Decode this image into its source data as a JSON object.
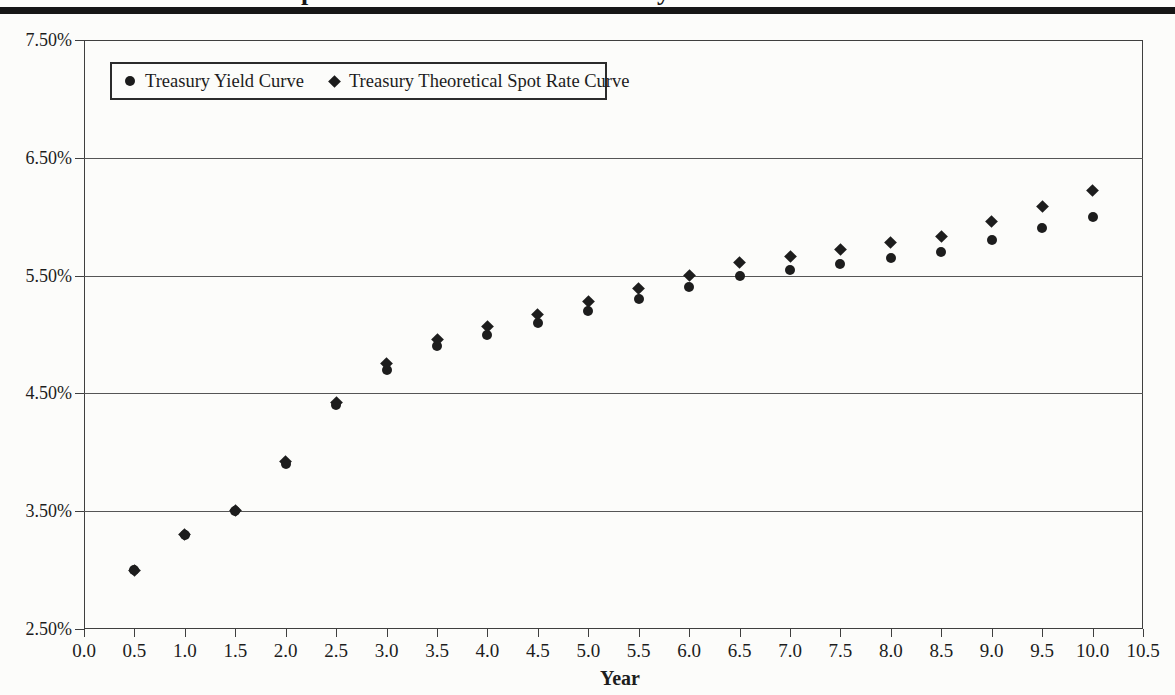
{
  "header": {
    "clipped_title_fragments": [
      "p",
      "y"
    ]
  },
  "legend": {
    "items": [
      {
        "marker": "circle",
        "label": "Treasury Yield Curve"
      },
      {
        "marker": "diamond",
        "label": "Treasury Theoretical Spot Rate Curve"
      }
    ]
  },
  "chart_data": {
    "type": "scatter",
    "title": "",
    "xlabel": "Year",
    "ylabel": "",
    "xlim": [
      0,
      10.5
    ],
    "ylim": [
      2.5,
      7.5
    ],
    "grid": "horizontal",
    "legend_position": "top-left-inside",
    "x_ticks": [
      "0.0",
      "0.5",
      "1.0",
      "1.5",
      "2.0",
      "2.5",
      "3.0",
      "3.5",
      "4.0",
      "4.5",
      "5.0",
      "5.5",
      "6.0",
      "6.5",
      "7.0",
      "7.5",
      "8.0",
      "8.5",
      "9.0",
      "9.5",
      "10.0",
      "10.5"
    ],
    "y_ticks": [
      "2.50%",
      "3.50%",
      "4.50%",
      "5.50%",
      "6.50%",
      "7.50%"
    ],
    "x": [
      0.5,
      1.0,
      1.5,
      2.0,
      2.5,
      3.0,
      3.5,
      4.0,
      4.5,
      5.0,
      5.5,
      6.0,
      6.5,
      7.0,
      7.5,
      8.0,
      8.5,
      9.0,
      9.5,
      10.0
    ],
    "series": [
      {
        "name": "Treasury Yield Curve",
        "marker": "circle",
        "values": [
          3.0,
          3.3,
          3.5,
          3.9,
          4.4,
          4.7,
          4.9,
          5.0,
          5.1,
          5.2,
          5.3,
          5.4,
          5.5,
          5.55,
          5.6,
          5.65,
          5.7,
          5.8,
          5.9,
          6.0
        ]
      },
      {
        "name": "Treasury Theoretical Spot Rate Curve",
        "marker": "diamond",
        "values": [
          3.0,
          3.3,
          3.51,
          3.92,
          4.42,
          4.75,
          4.96,
          5.07,
          5.17,
          5.28,
          5.39,
          5.5,
          5.61,
          5.66,
          5.72,
          5.78,
          5.83,
          5.96,
          6.09,
          6.22
        ]
      }
    ]
  }
}
